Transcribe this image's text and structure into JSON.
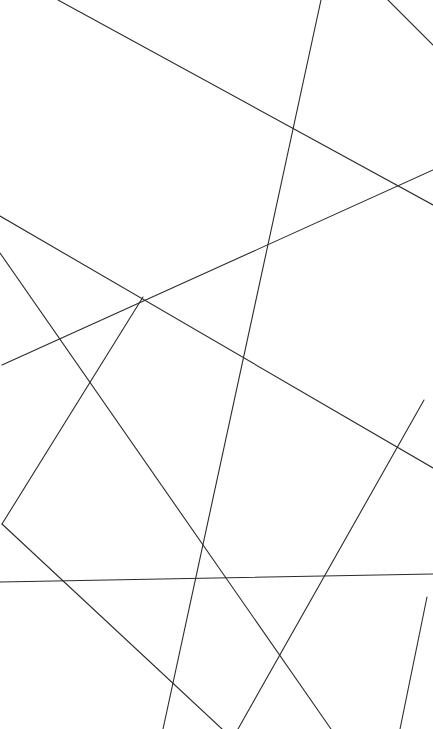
{
  "figure": {
    "width": 433,
    "height": 729,
    "background_color": "#ffffff",
    "stroke_color": "#2b2b2b",
    "stroke_width": 1.1,
    "segment_count": 9
  },
  "chart_data": {
    "type": "scatter",
    "subtitle": "",
    "xlabel": "",
    "ylabel": "",
    "xlim": [
      0,
      433
    ],
    "ylim": [
      0,
      729
    ],
    "grid": false,
    "legend": "none",
    "tick_labels_x": [],
    "tick_labels_y": [],
    "annotations": [],
    "segments": [
      {
        "name": "segment-1",
        "x1": 58,
        "y1": 0,
        "x2": 433,
        "y2": 205,
        "color": "#2b2b2b",
        "width": 1.1
      },
      {
        "name": "segment-2",
        "x1": 321,
        "y1": 0,
        "x2": 163,
        "y2": 729,
        "color": "#2b2b2b",
        "width": 1.1
      },
      {
        "name": "segment-3",
        "x1": 388,
        "y1": 0,
        "x2": 433,
        "y2": 45,
        "color": "#2b2b2b",
        "width": 1.1
      },
      {
        "name": "segment-4",
        "x1": 433,
        "y1": 170,
        "x2": 2,
        "y2": 365,
        "color": "#2b2b2b",
        "width": 1.1
      },
      {
        "name": "segment-5",
        "x1": 0,
        "y1": 216,
        "x2": 433,
        "y2": 468,
        "color": "#2b2b2b",
        "width": 1.1
      },
      {
        "name": "segment-6",
        "x1": 0,
        "y1": 253,
        "x2": 331,
        "y2": 729,
        "color": "#2b2b2b",
        "width": 1.1
      },
      {
        "name": "segment-7",
        "x1": 238,
        "y1": 729,
        "x2": 424,
        "y2": 400,
        "color": "#2b2b2b",
        "width": 1.1
      },
      {
        "name": "segment-8",
        "x1": 143,
        "y1": 297,
        "x2": 2,
        "y2": 524,
        "color": "#2b2b2b",
        "width": 1.1
      },
      {
        "name": "segment-9",
        "x1": 2,
        "y1": 524,
        "x2": 222,
        "y2": 729,
        "color": "#2b2b2b",
        "width": 1.1
      },
      {
        "name": "segment-10",
        "x1": 0,
        "y1": 582,
        "x2": 433,
        "y2": 574,
        "color": "#2b2b2b",
        "width": 1.1
      },
      {
        "name": "segment-11",
        "x1": 427,
        "y1": 597,
        "x2": 400,
        "y2": 729,
        "color": "#2b2b2b",
        "width": 1.1
      }
    ]
  }
}
